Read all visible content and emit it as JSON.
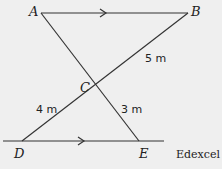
{
  "diagram": {
    "points": {
      "A": {
        "label": "A",
        "x": 41,
        "y": 13
      },
      "B": {
        "label": "B",
        "x": 188,
        "y": 13
      },
      "C": {
        "label": "C",
        "x": 96,
        "y": 84
      },
      "D": {
        "label": "D",
        "x": 22,
        "y": 141
      },
      "E": {
        "label": "E",
        "x": 139,
        "y": 141
      }
    },
    "lengths": {
      "BC": "5 m",
      "CD": "4 m",
      "CE": "3 m"
    },
    "parallel_marks": [
      "AB",
      "DE"
    ],
    "source": "Edexcel",
    "colors": {
      "background": "#efefef",
      "stroke": "#333333"
    }
  }
}
